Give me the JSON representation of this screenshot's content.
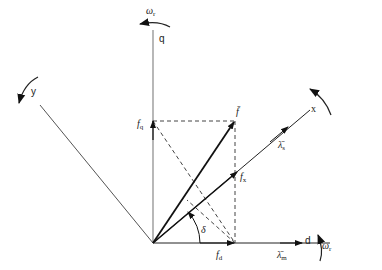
{
  "diagram": {
    "type": "vector-phasor-diagram",
    "axes": {
      "d": {
        "label": "d",
        "rotation_label": "ω",
        "rotation_subscript": "r"
      },
      "q": {
        "label": "q",
        "rotation_label": "ω",
        "rotation_subscript": "r"
      },
      "x": {
        "label": "x"
      },
      "y": {
        "label": "y"
      }
    },
    "vectors": {
      "f": {
        "label": "f̄"
      },
      "fx": {
        "label": "f",
        "subscript": "x"
      },
      "fd": {
        "label": "f",
        "subscript": "d"
      },
      "fq": {
        "label": "f",
        "subscript": "q"
      },
      "lambda_s": {
        "label": "λ̄",
        "subscript": "s"
      },
      "lambda_m": {
        "label": "λ̄",
        "subscript": "m"
      }
    },
    "angle": {
      "label": "δ"
    },
    "colors": {
      "line": "#222222",
      "axis": "#777777",
      "dashed": "#444444"
    }
  }
}
